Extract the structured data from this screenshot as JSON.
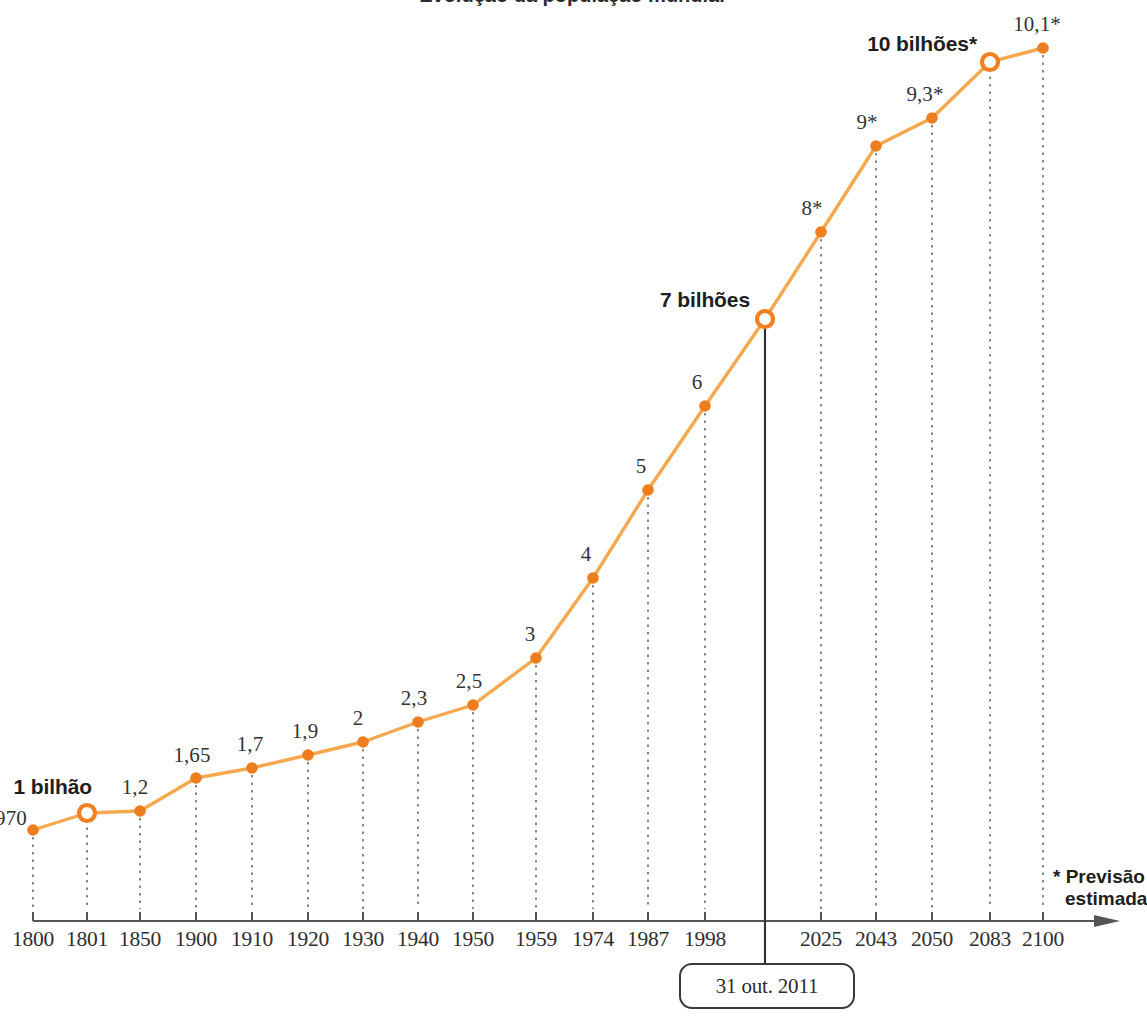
{
  "chart_data": {
    "type": "line",
    "title": "Evolução da população mundial",
    "xlabel": "",
    "ylabel": "",
    "grid": false,
    "legend_position": "bottom-right",
    "categories": [
      "1800",
      "1801",
      "1850",
      "1900",
      "1910",
      "1920",
      "1930",
      "1940",
      "1950",
      "1959",
      "1974",
      "1987",
      "1998",
      "2011",
      "2025",
      "2043",
      "2050",
      "2083",
      "2100"
    ],
    "tick_labels": [
      "1800",
      "1801",
      "1850",
      "1900",
      "1910",
      "1920",
      "1930",
      "1940",
      "1950",
      "1959",
      "1974",
      "1987",
      "1998",
      "2025",
      "2043",
      "2050",
      "2083",
      "2100"
    ],
    "point_labels": [
      "970",
      "1 bilhão",
      "1,2",
      "1,65",
      "1,7",
      "1,9",
      "2",
      "2,3",
      "2,5",
      "3",
      "4",
      "5",
      "6",
      "7 bilhões",
      "8*",
      "9*",
      "9,3*",
      "10 bilhões*",
      "10,1*"
    ],
    "values": [
      0.97,
      1,
      1.2,
      1.65,
      1.7,
      1.9,
      2,
      2.3,
      2.5,
      3,
      4,
      5,
      6,
      7,
      8,
      9,
      9.3,
      10,
      10.1
    ],
    "units": "bilhões de habitantes",
    "points": [
      {
        "year": "1800",
        "label": "970",
        "value": 0.97,
        "x": 33,
        "y": 830,
        "marker": "solid",
        "label_dx": -22,
        "label_dy": -12,
        "label_anchor": "end"
      },
      {
        "year": "1801",
        "label": "1 bilhão",
        "value": 1,
        "x": 87,
        "y": 813,
        "marker": "hollow",
        "milestone": true,
        "label_x": 92,
        "label_y": 787
      },
      {
        "year": "1850",
        "label": "1,2",
        "value": 1.2,
        "x": 140,
        "y": 811,
        "marker": "solid",
        "label_x": 135,
        "label_y": 800
      },
      {
        "year": "1900",
        "label": "1,65",
        "value": 1.65,
        "x": 196,
        "y": 778,
        "marker": "solid",
        "label_x": 192,
        "label_y": 768
      },
      {
        "year": "1910",
        "label": "1,7",
        "value": 1.7,
        "x": 252,
        "y": 768,
        "marker": "solid",
        "label_x": 250,
        "label_y": 757
      },
      {
        "year": "1920",
        "label": "1,9",
        "value": 1.9,
        "x": 308,
        "y": 755,
        "marker": "solid",
        "label_x": 305,
        "label_y": 744
      },
      {
        "year": "1930",
        "label": "2",
        "value": 2,
        "x": 363,
        "y": 742,
        "marker": "solid",
        "label_x": 358,
        "label_y": 731
      },
      {
        "year": "1940",
        "label": "2,3",
        "value": 2.3,
        "x": 418,
        "y": 722,
        "marker": "solid",
        "label_x": 414,
        "label_y": 711
      },
      {
        "year": "1950",
        "label": "2,5",
        "value": 2.5,
        "x": 473,
        "y": 705,
        "marker": "solid",
        "label_x": 469,
        "label_y": 694
      },
      {
        "year": "1959",
        "label": "3",
        "value": 3,
        "x": 536,
        "y": 658,
        "marker": "solid",
        "label_x": 530,
        "label_y": 647
      },
      {
        "year": "1974",
        "label": "4",
        "value": 4,
        "x": 593,
        "y": 578,
        "marker": "solid",
        "label_x": 586,
        "label_y": 567
      },
      {
        "year": "1987",
        "label": "5",
        "value": 5,
        "x": 648,
        "y": 490,
        "marker": "solid",
        "label_x": 641,
        "label_y": 479
      },
      {
        "year": "1998",
        "label": "6",
        "value": 6,
        "x": 705,
        "y": 406,
        "marker": "solid",
        "label_x": 697,
        "label_y": 395
      },
      {
        "year": "2011",
        "label": "7 bilhões",
        "value": 7,
        "x": 765,
        "y": 319,
        "marker": "hollow",
        "milestone": true,
        "label_x": 750,
        "label_y": 300
      },
      {
        "year": "2025",
        "label": "8*",
        "value": 8,
        "x": 821,
        "y": 232,
        "marker": "solid",
        "label_x": 812,
        "label_y": 221
      },
      {
        "year": "2043",
        "label": "9*",
        "value": 9,
        "x": 876,
        "y": 146,
        "marker": "solid",
        "label_x": 867,
        "label_y": 135
      },
      {
        "year": "2050",
        "label": "9,3*",
        "value": 9.3,
        "x": 932,
        "y": 118,
        "marker": "solid",
        "label_x": 925,
        "label_y": 107
      },
      {
        "year": "2083",
        "label": "10 bilhões*",
        "value": 10,
        "x": 990,
        "y": 62,
        "marker": "hollow",
        "milestone": true,
        "label_x": 977,
        "label_y": 44
      },
      {
        "year": "2100",
        "label": "10,1*",
        "value": 10.1,
        "x": 1043,
        "y": 48,
        "marker": "solid",
        "label_x": 1037,
        "label_y": 37
      }
    ],
    "annotations": [
      {
        "name": "date-callout",
        "text": "31 out. 2011",
        "at_year": "2011"
      },
      {
        "name": "forecast-note",
        "line1": "* Previsão",
        "line2": "estimada"
      }
    ],
    "axis": {
      "baseline_y": 921,
      "left_x": 33,
      "right_x": 1120,
      "tick_height": 9
    }
  },
  "colors": {
    "line": "#F5A84E",
    "marker_fill": "#ED7D1E",
    "marker_ring": "#F08020",
    "axis": "#555555",
    "dotted_guide": "#6b6b6b",
    "callout_line": "#2f2f2f",
    "text": "#2b2b2b",
    "background": "#ffffff"
  },
  "axis_ticks": [
    {
      "label": "1800",
      "x": 33
    },
    {
      "label": "1801",
      "x": 87
    },
    {
      "label": "1850",
      "x": 140
    },
    {
      "label": "1900",
      "x": 196
    },
    {
      "label": "1910",
      "x": 252
    },
    {
      "label": "1920",
      "x": 308
    },
    {
      "label": "1930",
      "x": 363
    },
    {
      "label": "1940",
      "x": 418
    },
    {
      "label": "1950",
      "x": 473
    },
    {
      "label": "1959",
      "x": 536
    },
    {
      "label": "1974",
      "x": 593
    },
    {
      "label": "1987",
      "x": 648
    },
    {
      "label": "1998",
      "x": 705
    },
    {
      "label": "2025",
      "x": 821
    },
    {
      "label": "2043",
      "x": 876
    },
    {
      "label": "2050",
      "x": 932
    },
    {
      "label": "2083",
      "x": 990
    },
    {
      "label": "2100",
      "x": 1043
    }
  ],
  "callout": {
    "text": "31 out. 2011",
    "x": 765
  },
  "forecast": {
    "line1": "* Previsão",
    "line2": "estimada"
  },
  "title": {
    "text": "Evolução da população mundial"
  }
}
